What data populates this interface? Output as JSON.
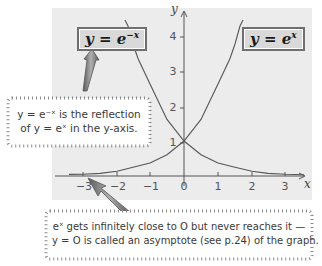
{
  "labels": {
    "left_box": {
      "prefix": "y = e",
      "exponent": "−x"
    },
    "right_box": {
      "prefix": "y = e",
      "exponent": "x"
    }
  },
  "notes": {
    "reflection": {
      "line1": "y = e⁻ˣ is the reflection",
      "line2": "of y = eˣ in the y-axis."
    },
    "asymptote": {
      "line1": "eˣ gets infinitely close to O but never reaches it —",
      "line2": "y = O is called an asymptote (see p.24) of the graph."
    }
  },
  "axes": {
    "x_label": "x",
    "y_label": "y",
    "x_ticks": [
      "−3",
      "−2",
      "−1",
      "0",
      "1",
      "2",
      "3"
    ],
    "y_ticks": [
      "1",
      "2",
      "3",
      "4"
    ]
  },
  "colors": {
    "panel": "#ececec",
    "curve": "#555555",
    "axis": "#555555",
    "box_fill": "#d9d9d9",
    "arrow": "#777777"
  }
}
